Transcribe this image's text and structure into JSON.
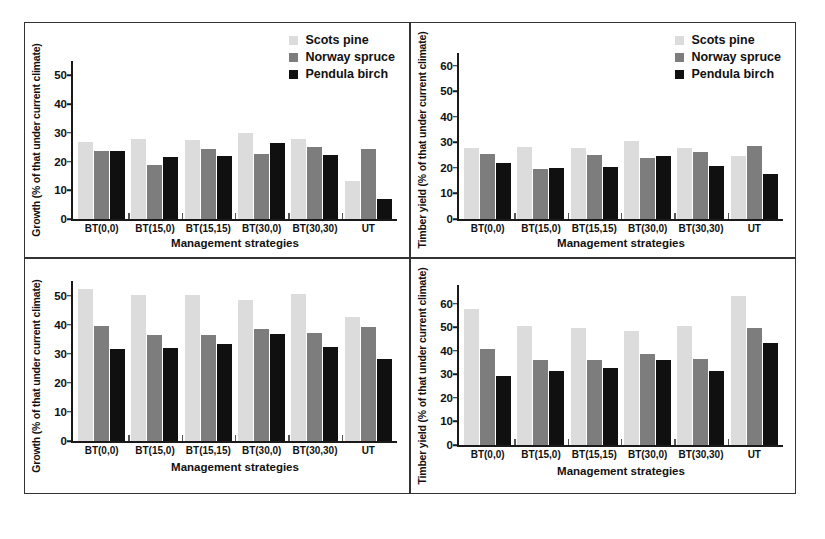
{
  "figure": {
    "series_colors": {
      "scots_pine": "#dcdcdc",
      "norway_spruce": "#7d7d7d",
      "pendula_birch": "#101010"
    },
    "legend_entries": [
      "Scots pine",
      "Norway spruce",
      "Pendula birch"
    ],
    "xlabel": "Management strategies",
    "categories": [
      "BT(0,0)",
      "BT(15,0)",
      "BT(15,15)",
      "BT(30,0)",
      "BT(30,30)",
      "UT"
    ]
  },
  "panels": [
    {
      "id": "top-left",
      "ylabel": "Growth (% of that under current climate)",
      "xlabel": "Management strategies",
      "yticks": [
        "0",
        "10",
        "20",
        "30",
        "40",
        "50"
      ],
      "legend": [
        "Scots pine",
        "Norway spruce",
        "Pendula birch"
      ]
    },
    {
      "id": "top-right",
      "ylabel": "Timber yield (% of that under current climate)",
      "xlabel": "Management strategies",
      "yticks": [
        "0",
        "10",
        "20",
        "30",
        "40",
        "50",
        "60"
      ],
      "legend": [
        "Scots pine",
        "Norway spruce",
        "Pendula birch"
      ]
    },
    {
      "id": "bottom-left",
      "ylabel": "Growth (% of that under current climate)",
      "xlabel": "Management strategies",
      "yticks": [
        "0",
        "10",
        "20",
        "30",
        "40",
        "50"
      ],
      "legend": []
    },
    {
      "id": "bottom-right",
      "ylabel": "Timber yield (% of that under current climate)",
      "xlabel": "Management strategies",
      "yticks": [
        "0",
        "10",
        "20",
        "30",
        "40",
        "50",
        "60"
      ],
      "legend": []
    }
  ],
  "chart_data": [
    {
      "type": "bar",
      "panel": "top-left",
      "title": "",
      "xlabel": "Management strategies",
      "ylabel": "Growth (% of that under current climate)",
      "categories": [
        "BT(0,0)",
        "BT(15,0)",
        "BT(15,15)",
        "BT(30,0)",
        "BT(30,30)",
        "UT"
      ],
      "series": [
        {
          "name": "Scots pine",
          "color": "#dcdcdc",
          "values": [
            26.8,
            27.8,
            27.5,
            30.0,
            27.7,
            13.2
          ]
        },
        {
          "name": "Norway spruce",
          "color": "#7d7d7d",
          "values": [
            23.8,
            18.8,
            24.5,
            22.7,
            24.9,
            24.2
          ]
        },
        {
          "name": "Pendula birch",
          "color": "#101010",
          "values": [
            23.7,
            21.6,
            22.0,
            26.4,
            22.4,
            6.9
          ]
        }
      ],
      "ylim": [
        0,
        55
      ],
      "ytick_values": [
        0,
        10,
        20,
        30,
        40,
        50
      ],
      "grid": false,
      "legend_position": "top-right"
    },
    {
      "type": "bar",
      "panel": "top-right",
      "title": "",
      "xlabel": "Management strategies",
      "ylabel": "Timber yield (% of that under current climate)",
      "categories": [
        "BT(0,0)",
        "BT(15,0)",
        "BT(15,15)",
        "BT(30,0)",
        "BT(30,30)",
        "UT"
      ],
      "series": [
        {
          "name": "Scots pine",
          "color": "#dcdcdc",
          "values": [
            28.0,
            28.3,
            28.0,
            30.5,
            28.0,
            24.8
          ]
        },
        {
          "name": "Norway spruce",
          "color": "#7d7d7d",
          "values": [
            25.5,
            19.6,
            25.1,
            24.0,
            26.1,
            28.7
          ]
        },
        {
          "name": "Pendula birch",
          "color": "#101010",
          "values": [
            22.1,
            20.0,
            20.2,
            24.6,
            20.7,
            17.7
          ]
        }
      ],
      "ylim": [
        0,
        65
      ],
      "ytick_values": [
        0,
        10,
        20,
        30,
        40,
        50,
        60
      ],
      "grid": false,
      "legend_position": "top-right"
    },
    {
      "type": "bar",
      "panel": "bottom-left",
      "title": "",
      "xlabel": "Management strategies",
      "ylabel": "Growth (% of that under current climate)",
      "categories": [
        "BT(0,0)",
        "BT(15,0)",
        "BT(15,15)",
        "BT(30,0)",
        "BT(30,30)",
        "UT"
      ],
      "series": [
        {
          "name": "Scots pine",
          "color": "#dcdcdc",
          "values": [
            52.2,
            50.2,
            50.2,
            48.4,
            50.6,
            42.5
          ]
        },
        {
          "name": "Norway spruce",
          "color": "#7d7d7d",
          "values": [
            39.6,
            36.6,
            36.3,
            38.6,
            37.0,
            39.3
          ]
        },
        {
          "name": "Pendula birch",
          "color": "#101010",
          "values": [
            31.8,
            31.9,
            33.4,
            36.8,
            32.4,
            28.1
          ]
        }
      ],
      "ylim": [
        0,
        55
      ],
      "ytick_values": [
        0,
        10,
        20,
        30,
        40,
        50
      ],
      "grid": false,
      "legend_position": "none"
    },
    {
      "type": "bar",
      "panel": "bottom-right",
      "title": "",
      "xlabel": "Management strategies",
      "ylabel": "Timber yield (% of that under current climate)",
      "categories": [
        "BT(0,0)",
        "BT(15,0)",
        "BT(15,15)",
        "BT(30,0)",
        "BT(30,30)",
        "UT"
      ],
      "series": [
        {
          "name": "Scots pine",
          "color": "#dcdcdc",
          "values": [
            57.8,
            50.6,
            49.8,
            48.3,
            50.6,
            63.2
          ]
        },
        {
          "name": "Norway spruce",
          "color": "#7d7d7d",
          "values": [
            41.0,
            36.3,
            36.2,
            38.8,
            36.7,
            49.6
          ]
        },
        {
          "name": "Pendula birch",
          "color": "#101010",
          "values": [
            29.3,
            31.3,
            32.7,
            36.1,
            31.3,
            43.5
          ]
        }
      ],
      "ylim": [
        0,
        68
      ],
      "ytick_values": [
        0,
        10,
        20,
        30,
        40,
        50,
        60
      ],
      "grid": false,
      "legend_position": "none"
    }
  ]
}
